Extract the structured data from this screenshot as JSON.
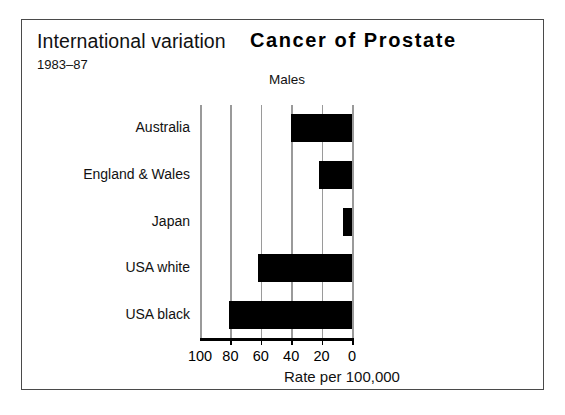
{
  "header": {
    "title_left": "International variation",
    "title_main": "Cancer of Prostate",
    "period": "1983–87",
    "subtitle": "Males"
  },
  "axis": {
    "xlabel": "Rate per 100,000",
    "tick_labels": [
      "100",
      "80",
      "60",
      "40",
      "20",
      "0"
    ]
  },
  "chart_data": {
    "type": "bar",
    "orientation": "horizontal",
    "title": "Cancer of Prostate",
    "subtitle": "Males",
    "annotation_left": "International variation",
    "annotation_period": "1983–87",
    "categories": [
      "Australia",
      "England & Wales",
      "Japan",
      "USA white",
      "USA black"
    ],
    "values": [
      40,
      22,
      6,
      62,
      81
    ],
    "xlabel": "Rate per 100,000",
    "ylabel": "",
    "xlim": [
      100,
      0
    ],
    "x_axis_reversed": true,
    "xticks": [
      100,
      80,
      60,
      40,
      20,
      0
    ],
    "grid": true,
    "legend": false,
    "bar_color": "#000000",
    "gridline_color": "#9a9a9a"
  }
}
